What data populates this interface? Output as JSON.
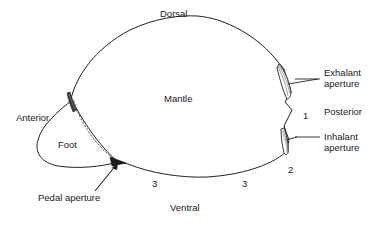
{
  "figure": {
    "background_color": "#ffffff",
    "line_color": "#222222",
    "text_color": "#1a1a1a"
  },
  "orientation_labels": {
    "dorsal": "Dorsal",
    "ventral": "Ventral",
    "anterior": "Anterior",
    "posterior": "Posterior"
  },
  "anatomy_labels": {
    "mantle": "Mantle",
    "foot": "Foot",
    "exhalant_aperture_line1": "Exhalant",
    "exhalant_aperture_line2": "aperture",
    "inhalant_aperture_line1": "Inhalant",
    "inhalant_aperture_line2": "aperture",
    "pedal_aperture": "Pedal aperture"
  },
  "fusion_point_numbers": {
    "point_1": "1",
    "point_2": "2",
    "point_3_left": "3",
    "point_3_right": "3"
  }
}
